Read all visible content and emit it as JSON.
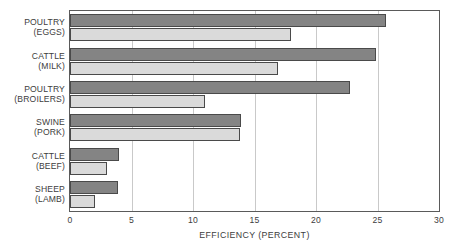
{
  "chart_data": {
    "type": "bar",
    "orientation": "horizontal",
    "title": "",
    "xlabel": "EFFICIENCY (PERCENT)",
    "ylabel": "",
    "xlim": [
      0,
      30
    ],
    "xticks": [
      0,
      5,
      10,
      15,
      20,
      25,
      30
    ],
    "xtick_labels": [
      "0",
      "5",
      "10",
      "15",
      "20",
      "25",
      "30"
    ],
    "grid": "vertical",
    "legend": "none",
    "categories": [
      "POULTRY (EGGS)",
      "CATTLE (MILK)",
      "POULTRY (BROILERS)",
      "SWINE (PORK)",
      "CATTLE (BEEF)",
      "SHEEP (LAMB)"
    ],
    "category_lines": [
      [
        "POULTRY",
        "(EGGS)"
      ],
      [
        "CATTLE",
        "(MILK)"
      ],
      [
        "POULTRY",
        "(BROILERS)"
      ],
      [
        "SWINE",
        "(PORK)"
      ],
      [
        "CATTLE",
        "(BEEF)"
      ],
      [
        "SHEEP",
        "(LAMB)"
      ]
    ],
    "series": [
      {
        "name": "series-dark",
        "color": "#848484",
        "values": [
          25.7,
          24.9,
          22.8,
          13.9,
          4.0,
          3.9
        ]
      },
      {
        "name": "series-light",
        "color": "#dadada",
        "values": [
          18.0,
          16.9,
          11.0,
          13.8,
          3.0,
          2.0
        ]
      }
    ]
  },
  "colors": {
    "series_dark": "#848484",
    "series_light": "#dadada",
    "bar_outline": "#4a4a4a",
    "frame": "#5a5a5a",
    "gridline": "#c9c9c9",
    "text": "#3d3d3d",
    "background": "#ffffff"
  }
}
